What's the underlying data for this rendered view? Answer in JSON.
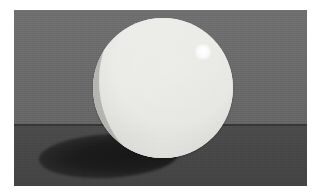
{
  "image": {
    "title": "Rendered sphere with cast shadow",
    "width": 318,
    "height": 196,
    "margin_color": "#ffffff",
    "caption": ""
  },
  "scene": {
    "name": "raytraced-sphere-scene",
    "frame": {
      "x": 14,
      "y": 10,
      "width": 293,
      "height": 176
    },
    "wall": {
      "label": "background wall",
      "color": "#6d6d6d",
      "color_top": "#6f6f6f",
      "color_bottom": "#666666",
      "height": 115
    },
    "horizon": {
      "label": "horizon seam",
      "color": "#2e2e2e",
      "y": 125
    },
    "floor": {
      "label": "ground plane",
      "color": "#474747",
      "color_near": "#4b4b4b",
      "color_far": "#434343",
      "y": 126
    }
  },
  "sphere": {
    "label": "sphere",
    "center_x": 163,
    "center_y": 92,
    "radius": 70,
    "lit_color": "#eaeae7",
    "shadow_color": "#bbbbb6",
    "terminator_label": "terminator"
  },
  "specular": {
    "label": "specular highlight",
    "center_x": 202,
    "center_y": 51,
    "radius": 8,
    "color": "#ffffff"
  },
  "cast_shadow": {
    "label": "cast shadow",
    "center_x": 120,
    "center_y": 150,
    "width": 140,
    "height": 44,
    "color": "#1a1a1a",
    "rotation_deg": -3
  },
  "light": {
    "label": "key light",
    "direction": "upper-right",
    "type": "point"
  }
}
